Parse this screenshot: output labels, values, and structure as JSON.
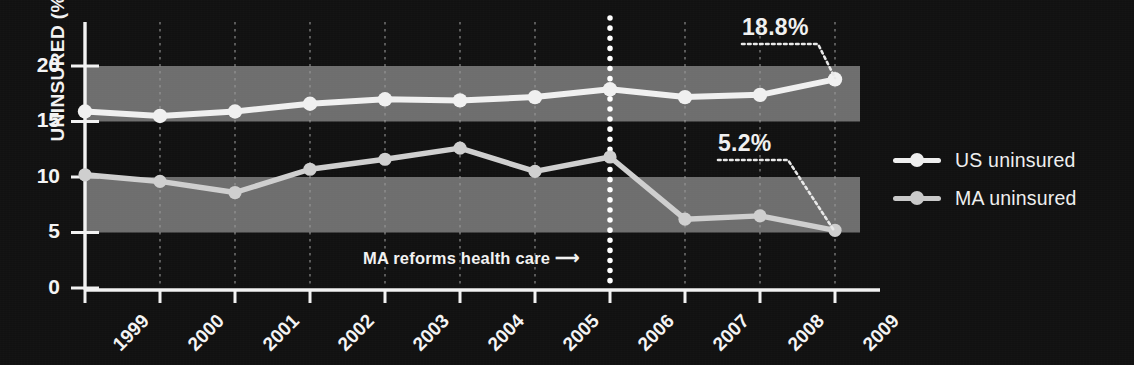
{
  "chart_data": {
    "type": "line",
    "title": "",
    "subtitle": "",
    "xlabel": "",
    "ylabel": "UNINSURED (%)",
    "x": [
      "1999",
      "2000",
      "2001",
      "2002",
      "2003",
      "2004",
      "2005",
      "2006",
      "2007",
      "2008",
      "2009"
    ],
    "categories": [
      "1999",
      "2000",
      "2001",
      "2002",
      "2003",
      "2004",
      "2005",
      "2006",
      "2007",
      "2008",
      "2009"
    ],
    "series": [
      {
        "name": "US uninsured",
        "color": "#f0f0f0",
        "values": [
          15.9,
          15.5,
          15.9,
          16.6,
          17.0,
          16.9,
          17.2,
          17.9,
          17.2,
          17.4,
          18.8
        ]
      },
      {
        "name": "MA uninsured",
        "color": "#cfcfcf",
        "values": [
          10.2,
          9.6,
          8.6,
          10.7,
          11.6,
          12.6,
          10.5,
          11.8,
          6.2,
          6.5,
          5.2
        ]
      }
    ],
    "ylim": [
      0,
      22.5
    ],
    "yticks": [
      0,
      5,
      10,
      15,
      20
    ],
    "ytick_labels": [
      "0",
      "5",
      "10",
      "15",
      "20"
    ],
    "grid": "vertical dotted gridlines at each year; alternating horizontal shaded bands 5-10 and 15-20",
    "legend_position": "right",
    "annotations": [
      {
        "name": "us-2009-callout",
        "text": "18.8%",
        "target_series": "US uninsured",
        "target_x": "2009",
        "target_y": 18.8
      },
      {
        "name": "ma-2009-callout",
        "text": "5.2%",
        "target_series": "MA uninsured",
        "target_x": "2009",
        "target_y": 5.2
      },
      {
        "name": "reform-marker",
        "text": "MA reforms health care ⟶",
        "target_x": "2006",
        "style": "vertical dotted white line"
      }
    ],
    "bands": [
      {
        "from": 5,
        "to": 10,
        "color": "#6e6e6e"
      },
      {
        "from": 15,
        "to": 20,
        "color": "#6e6e6e"
      }
    ]
  },
  "axes": {
    "y_title": "UNINSURED (%)",
    "y_ticks": [
      "20",
      "15",
      "10",
      "5",
      "0"
    ],
    "x_ticks": [
      "1999",
      "2000",
      "2001",
      "2002",
      "2003",
      "2004",
      "2005",
      "2006",
      "2007",
      "2008",
      "2009"
    ]
  },
  "callouts": {
    "us_value": "18.8%",
    "ma_value": "5.2%",
    "reform_note": "MA reforms health care ⟶"
  },
  "legend": {
    "items": [
      {
        "label": "US uninsured",
        "color": "#f0f0f0"
      },
      {
        "label": "MA uninsured",
        "color": "#c9c9c9"
      }
    ]
  },
  "colors": {
    "background": "#111111",
    "band": "#6e6e6e",
    "axis": "#f2f2f2",
    "us_line": "#f0f0f0",
    "ma_line": "#cbcbcb",
    "gridline": "#8a8a8a"
  }
}
